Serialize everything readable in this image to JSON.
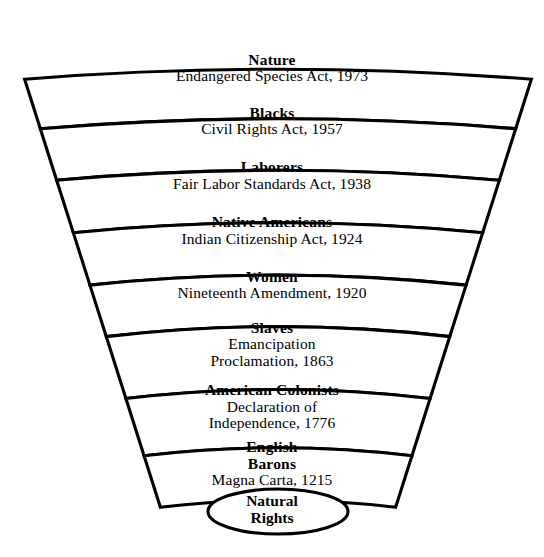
{
  "diagram": {
    "type": "fan-hierarchy",
    "title_visible": false,
    "background_color": "#ffffff",
    "line_color": "#000000",
    "text_color": "#000000",
    "base": {
      "shape": "ellipse",
      "line1": "Natural",
      "line2": "Rights"
    },
    "bands": [
      {
        "id": "nature",
        "title": "Nature",
        "subtitle": "Endangered Species Act, 1973",
        "year": 1973,
        "title_lines": 1,
        "subtitle_lines": 1
      },
      {
        "id": "blacks",
        "title": "Blacks",
        "subtitle": "Civil Rights Act, 1957",
        "year": 1957,
        "title_lines": 1,
        "subtitle_lines": 1
      },
      {
        "id": "laborers",
        "title": "Laborers",
        "subtitle": "Fair Labor Standards Act, 1938",
        "year": 1938,
        "title_lines": 1,
        "subtitle_lines": 1
      },
      {
        "id": "native-americans",
        "title": "Native Americans",
        "subtitle": "Indian Citizenship Act, 1924",
        "year": 1924,
        "title_lines": 1,
        "subtitle_lines": 1
      },
      {
        "id": "women",
        "title": "Women",
        "subtitle": "Nineteenth Amendment, 1920",
        "year": 1920,
        "title_lines": 1,
        "subtitle_lines": 1
      },
      {
        "id": "slaves",
        "title": "Slaves",
        "subtitle": "Emancipation Proclamation, 1863",
        "subtitle_line1": "Emancipation",
        "subtitle_line2": "Proclamation, 1863",
        "year": 1863,
        "title_lines": 1,
        "subtitle_lines": 2
      },
      {
        "id": "american-colonists",
        "title": "American Colonists",
        "subtitle": "Declaration of Independence, 1776",
        "subtitle_line1": "Declaration of",
        "subtitle_line2": "Independence, 1776",
        "year": 1776,
        "title_lines": 1,
        "subtitle_lines": 2
      },
      {
        "id": "english-barons",
        "title": "English Barons",
        "title_line1": "English",
        "title_line2": "Barons",
        "subtitle": "Magna Carta, 1215",
        "year": 1215,
        "title_lines": 2,
        "subtitle_lines": 1
      }
    ]
  }
}
